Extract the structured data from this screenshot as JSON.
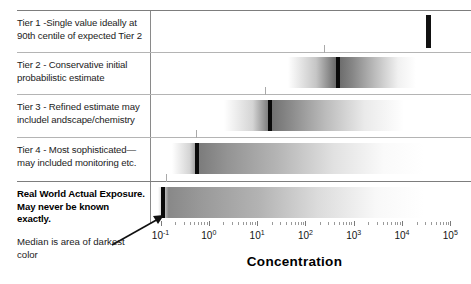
{
  "figure": {
    "axis_title": "Concentration",
    "annotation": "Median is area of darkest color"
  },
  "rows": [
    {
      "id": "tier-1",
      "label": "Tier 1 -Single value ideally at 90th centile of expected Tier 2",
      "bold": false
    },
    {
      "id": "tier-2",
      "label": "Tier 2 - Conservative initial probabilistic estimate",
      "bold": false
    },
    {
      "id": "tier-3",
      "label": "Tier 3 - Refined estimate may includel andscape/chemistry",
      "bold": false
    },
    {
      "id": "tier-4",
      "label": "Tier 4 - Most sophisticated—may included monitoring etc.",
      "bold": false
    },
    {
      "id": "real-world",
      "label": "Real World Actual Exposure.  May never be known exactly.",
      "bold": true
    }
  ],
  "axis": {
    "tick_labels": [
      "10-1",
      "100",
      "101",
      "102",
      "103",
      "104",
      "105"
    ],
    "tick_bases": [
      "10",
      "10",
      "10",
      "10",
      "10",
      "10",
      "10"
    ],
    "tick_exponents": [
      "-1",
      "0",
      "1",
      "2",
      "3",
      "4",
      "5"
    ]
  },
  "chart_data": {
    "type": "bar",
    "title": "",
    "xlabel": "Concentration",
    "ylabel": "",
    "xscale": "log",
    "xlim": [
      0.1,
      100000
    ],
    "grid": false,
    "legend": null,
    "annotations": [
      {
        "text": "Median is area of darkest color",
        "points_to": "real-world median bar"
      }
    ],
    "categories": [
      "Tier 1 -Single value ideally at 90th centile of expected Tier 2",
      "Tier 2 - Conservative initial probabilistic estimate",
      "Tier 3 - Refined estimate may includel andscape/chemistry",
      "Tier 4 - Most sophisticated—may included monitoring etc.",
      "Real World Actual Exposure.  May never be known exactly."
    ],
    "series": [
      {
        "name": "Exposure distribution (median = darkest band)",
        "rows": [
          {
            "category": "Tier 1",
            "median": 50000,
            "low": 50000,
            "high": 50000,
            "distribution": false
          },
          {
            "category": "Tier 2",
            "median": 600,
            "low": 60,
            "high": 20000,
            "distribution": true
          },
          {
            "category": "Tier 3",
            "median": 30,
            "low": 1.2,
            "high": 6000,
            "distribution": true
          },
          {
            "category": "Tier 4",
            "median": 1.0,
            "low": 0.28,
            "high": 50000,
            "distribution": true
          },
          {
            "category": "Real World",
            "median": 0.2,
            "low": 0.13,
            "high": 50000,
            "distribution": true
          }
        ]
      }
    ]
  }
}
